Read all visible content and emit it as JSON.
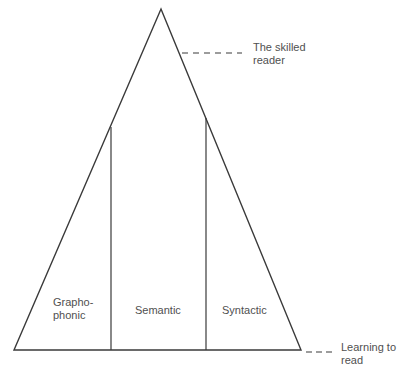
{
  "diagram": {
    "type": "triangle-model",
    "segments": [
      {
        "label_line1": "Grapho-",
        "label_line2": "phonic"
      },
      {
        "label": "Semantic"
      },
      {
        "label": "Syntactic"
      }
    ],
    "annotations": {
      "top": {
        "line1": "The skilled",
        "line2": "reader"
      },
      "bottom": {
        "line1": "Learning to",
        "line2": "read"
      }
    },
    "colors": {
      "line": "#3a3a3a",
      "text": "#505050",
      "background": "#ffffff"
    }
  }
}
